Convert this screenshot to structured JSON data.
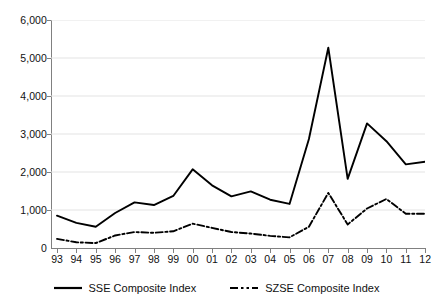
{
  "chart_data": {
    "type": "line",
    "title": "",
    "subtitle": "",
    "xlabel": "",
    "ylabel": "",
    "x": [
      "93",
      "94",
      "95",
      "96",
      "97",
      "98",
      "99",
      "00",
      "01",
      "02",
      "03",
      "04",
      "05",
      "06",
      "07",
      "08",
      "09",
      "10",
      "11",
      "12"
    ],
    "categories": [
      "93",
      "94",
      "95",
      "96",
      "97",
      "98",
      "99",
      "00",
      "01",
      "02",
      "03",
      "04",
      "05",
      "06",
      "07",
      "08",
      "09",
      "10",
      "11",
      "12"
    ],
    "series": [
      {
        "name": "SSE Composite Index",
        "style": "solid",
        "color": "#000000",
        "values": [
          850,
          660,
          560,
          920,
          1200,
          1130,
          1370,
          2070,
          1650,
          1360,
          1490,
          1270,
          1160,
          2870,
          5270,
          1820,
          3280,
          2810,
          2200,
          2270
        ]
      },
      {
        "name": "SZSE Composite Index",
        "style": "dash-dot",
        "color": "#000000",
        "values": [
          240,
          150,
          130,
          330,
          420,
          400,
          440,
          640,
          530,
          420,
          380,
          320,
          280,
          560,
          1450,
          620,
          1040,
          1290,
          900,
          900
        ]
      }
    ],
    "ylim": [
      0,
      6000
    ],
    "yticks": [
      0,
      1000,
      2000,
      3000,
      4000,
      5000,
      6000
    ],
    "ytick_labels": [
      "0",
      "1,000",
      "2,000",
      "3,000",
      "4,000",
      "5,000",
      "6,000"
    ],
    "grid": true,
    "grid_axis": "y",
    "grid_color": "#e0e0e0",
    "legend_position": "bottom"
  },
  "legend": {
    "items": [
      {
        "label": "SSE Composite Index",
        "icon": "solid-line-swatch"
      },
      {
        "label": "SZSE Composite Index",
        "icon": "dash-dot-line-swatch"
      }
    ]
  }
}
